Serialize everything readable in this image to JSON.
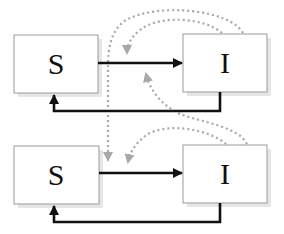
{
  "diagram": {
    "type": "compartment-model",
    "colors": {
      "box_border": "#9a9a9a",
      "box_shadow": "#e2e2e2",
      "solid_arrow": "#111111",
      "dotted_arrow": "#a8a8a8"
    },
    "patches": [
      {
        "nodes": [
          {
            "id": "S1",
            "label": "S"
          },
          {
            "id": "I1",
            "label": "I"
          }
        ]
      },
      {
        "nodes": [
          {
            "id": "S2",
            "label": "S"
          },
          {
            "id": "I2",
            "label": "I"
          }
        ]
      }
    ],
    "edges": [
      {
        "from": "S1",
        "to": "I1",
        "style": "solid",
        "meaning": "infection"
      },
      {
        "from": "I1",
        "to": "S1",
        "style": "solid",
        "meaning": "recovery"
      },
      {
        "from": "S2",
        "to": "I2",
        "style": "solid",
        "meaning": "infection"
      },
      {
        "from": "I2",
        "to": "S2",
        "style": "solid",
        "meaning": "recovery"
      },
      {
        "from": "I1",
        "to": "S1->I1",
        "style": "dotted",
        "meaning": "within-patch influence"
      },
      {
        "from": "I2",
        "to": "S1->I1",
        "style": "dotted",
        "meaning": "cross-patch influence"
      },
      {
        "from": "I2",
        "to": "S2->I2",
        "style": "dotted",
        "meaning": "within-patch influence"
      },
      {
        "from": "I1",
        "to": "S2->I2",
        "style": "dotted",
        "meaning": "cross-patch influence"
      }
    ]
  }
}
